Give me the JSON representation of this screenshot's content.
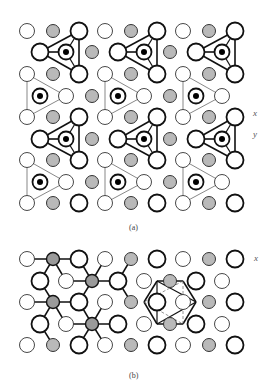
{
  "figure": {
    "panel_a": {
      "caption": "(a)",
      "axis_labels": [
        "x",
        "y"
      ],
      "legend": {
        "big_open": "large open atom (top layer)",
        "thin_open": "thin open atom (lower layer)",
        "gray": "gray filled atom",
        "ring_dot": "ringed atom with black center"
      },
      "rows": [
        {
          "y": 31,
          "atoms": [
            [
              "thin",
              27
            ],
            [
              "gray",
              53
            ],
            [
              "big",
              79
            ],
            [
              "thin",
              105
            ],
            [
              "gray",
              131
            ],
            [
              "big",
              157
            ],
            [
              "thin",
              183
            ],
            [
              "gray",
              209
            ],
            [
              "big",
              235
            ]
          ]
        },
        {
          "y": 52,
          "atoms": [
            [
              "big",
              40
            ],
            [
              "ringdot",
              66
            ],
            [
              "gray",
              92
            ],
            [
              "big",
              118
            ],
            [
              "ringdot",
              144
            ],
            [
              "gray",
              170
            ],
            [
              "big",
              196
            ],
            [
              "ringdot",
              222
            ]
          ]
        },
        {
          "y": 74,
          "atoms": [
            [
              "thin",
              27
            ],
            [
              "gray",
              53
            ],
            [
              "big",
              79
            ],
            [
              "thin",
              105
            ],
            [
              "gray",
              131
            ],
            [
              "big",
              157
            ],
            [
              "thin",
              183
            ],
            [
              "gray",
              209
            ],
            [
              "big",
              235
            ]
          ]
        },
        {
          "y": 96,
          "atoms": [
            [
              "ringdot",
              40
            ],
            [
              "thin",
              66
            ],
            [
              "gray",
              92
            ],
            [
              "ringdot",
              118
            ],
            [
              "thin",
              144
            ],
            [
              "gray",
              170
            ],
            [
              "ringdot",
              196
            ],
            [
              "thin",
              222
            ]
          ]
        },
        {
          "y": 117,
          "atoms": [
            [
              "thin",
              27
            ],
            [
              "gray",
              53
            ],
            [
              "big",
              79
            ],
            [
              "thin",
              105
            ],
            [
              "gray",
              131
            ],
            [
              "big",
              157
            ],
            [
              "thin",
              183
            ],
            [
              "gray",
              209
            ],
            [
              "big",
              235
            ]
          ]
        },
        {
          "y": 139,
          "atoms": [
            [
              "big",
              40
            ],
            [
              "ringdot",
              66
            ],
            [
              "gray",
              92
            ],
            [
              "big",
              118
            ],
            [
              "ringdot",
              144
            ],
            [
              "gray",
              170
            ],
            [
              "big",
              196
            ],
            [
              "ringdot",
              222
            ]
          ]
        },
        {
          "y": 160,
          "atoms": [
            [
              "thin",
              27
            ],
            [
              "gray",
              53
            ],
            [
              "big",
              79
            ],
            [
              "thin",
              105
            ],
            [
              "gray",
              131
            ],
            [
              "big",
              157
            ],
            [
              "thin",
              183
            ],
            [
              "gray",
              209
            ],
            [
              "big",
              235
            ]
          ]
        },
        {
          "y": 182,
          "atoms": [
            [
              "ringdot",
              40
            ],
            [
              "thin",
              66
            ],
            [
              "gray",
              92
            ],
            [
              "ringdot",
              118
            ],
            [
              "thin",
              144
            ],
            [
              "gray",
              170
            ],
            [
              "ringdot",
              196
            ],
            [
              "thin",
              222
            ]
          ]
        },
        {
          "y": 203,
          "atoms": [
            [
              "thin",
              27
            ],
            [
              "gray",
              53
            ],
            [
              "big",
              79
            ],
            [
              "thin",
              105
            ],
            [
              "gray",
              131
            ],
            [
              "big",
              157
            ],
            [
              "thin",
              183
            ],
            [
              "gray",
              209
            ],
            [
              "big",
              235
            ]
          ]
        }
      ],
      "bold_triangles": [
        [
          [
            40,
            52
          ],
          [
            79,
            31
          ],
          [
            79,
            74
          ],
          [
            66,
            52
          ]
        ],
        [
          [
            118,
            52
          ],
          [
            157,
            31
          ],
          [
            157,
            74
          ],
          [
            144,
            52
          ]
        ],
        [
          [
            196,
            52
          ],
          [
            235,
            31
          ],
          [
            235,
            74
          ],
          [
            222,
            52
          ]
        ],
        [
          [
            40,
            139
          ],
          [
            79,
            117
          ],
          [
            79,
            160
          ],
          [
            66,
            139
          ]
        ],
        [
          [
            118,
            139
          ],
          [
            157,
            117
          ],
          [
            157,
            160
          ],
          [
            144,
            139
          ]
        ],
        [
          [
            196,
            139
          ],
          [
            235,
            117
          ],
          [
            235,
            160
          ],
          [
            222,
            139
          ]
        ]
      ],
      "thin_triangles": [
        [
          [
            27,
            74
          ],
          [
            27,
            117
          ],
          [
            66,
            96
          ],
          [
            40,
            96
          ]
        ],
        [
          [
            105,
            74
          ],
          [
            105,
            117
          ],
          [
            144,
            96
          ],
          [
            118,
            96
          ]
        ],
        [
          [
            183,
            74
          ],
          [
            183,
            117
          ],
          [
            222,
            96
          ],
          [
            196,
            96
          ]
        ],
        [
          [
            27,
            160
          ],
          [
            27,
            203
          ],
          [
            66,
            182
          ],
          [
            40,
            182
          ]
        ],
        [
          [
            105,
            160
          ],
          [
            105,
            203
          ],
          [
            144,
            182
          ],
          [
            118,
            182
          ]
        ],
        [
          [
            183,
            160
          ],
          [
            183,
            203
          ],
          [
            222,
            182
          ],
          [
            196,
            182
          ]
        ]
      ]
    },
    "panel_b": {
      "caption": "(b)",
      "axis_labels": [
        "x"
      ],
      "rows": [
        {
          "y": 259,
          "atoms": [
            [
              "thin",
              27
            ],
            [
              "grayc",
              53
            ],
            [
              "big",
              79
            ],
            [
              "thin",
              105
            ],
            [
              "gray",
              131
            ],
            [
              "big",
              157
            ],
            [
              "thin",
              183
            ],
            [
              "gray",
              209
            ],
            [
              "big",
              235
            ]
          ]
        },
        {
          "y": 281,
          "atoms": [
            [
              "big",
              40
            ],
            [
              "thin",
              66
            ],
            [
              "grayx",
              92
            ],
            [
              "big",
              118
            ],
            [
              "thin",
              144
            ],
            [
              "gray",
              170
            ],
            [
              "big",
              196
            ],
            [
              "thin",
              222
            ]
          ]
        },
        {
          "y": 302,
          "atoms": [
            [
              "thin",
              27
            ],
            [
              "grayx",
              53
            ],
            [
              "big",
              79
            ],
            [
              "thin",
              105
            ],
            [
              "gray",
              131
            ],
            [
              "big",
              157
            ],
            [
              "thin",
              183
            ],
            [
              "gray",
              209
            ],
            [
              "big",
              235
            ]
          ]
        },
        {
          "y": 324,
          "atoms": [
            [
              "big",
              40
            ],
            [
              "thin",
              66
            ],
            [
              "grayx",
              92
            ],
            [
              "big",
              118
            ],
            [
              "thin",
              144
            ],
            [
              "gray",
              170
            ],
            [
              "big",
              196
            ],
            [
              "thin",
              222
            ]
          ]
        },
        {
          "y": 345,
          "atoms": [
            [
              "thin",
              27
            ],
            [
              "gray",
              53
            ],
            [
              "big",
              79
            ],
            [
              "thin",
              105
            ],
            [
              "gray",
              131
            ],
            [
              "big",
              157
            ],
            [
              "thin",
              183
            ],
            [
              "gray",
              209
            ],
            [
              "big",
              235
            ]
          ]
        }
      ]
    }
  }
}
